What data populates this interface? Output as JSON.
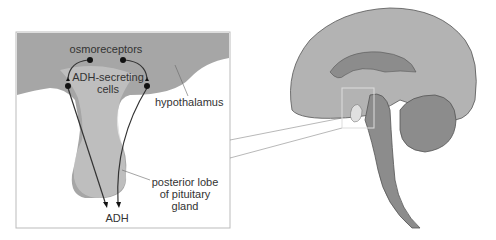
{
  "diagram": {
    "type": "anatomical illustration",
    "inset_labels": {
      "osmoreceptors": "osmoreceptors",
      "adh_cells_line1": "ADH-secreting",
      "adh_cells_line2": "cells",
      "hypothalamus": "hypothalamus",
      "posterior_line1": "posterior lobe",
      "posterior_line2": "of pituitary",
      "posterior_line3": "gland",
      "adh": "ADH"
    },
    "colors": {
      "hypothalamus": "#a6a6a6",
      "pituitary": "#d4d4d4",
      "brain_cortex": "#b3b3b3",
      "brain_inner": "#8c8c8c",
      "outline": "#444444",
      "inset_border": "#bbbbbb"
    }
  }
}
